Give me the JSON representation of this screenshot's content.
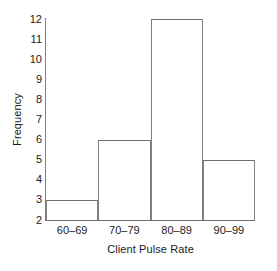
{
  "chart_data": {
    "type": "bar",
    "title": "",
    "subtitle": "",
    "xlabel": "Client Pulse Rate",
    "ylabel": "Frequency",
    "categories": [
      "60–69",
      "70–79",
      "80–89",
      "90–99"
    ],
    "values": [
      3,
      6,
      12,
      5
    ],
    "series": [
      {
        "name": "Frequency",
        "values": [
          3,
          6,
          12,
          5
        ]
      }
    ],
    "ylim": [
      2,
      12
    ],
    "yticks": [
      2,
      3,
      4,
      5,
      6,
      7,
      8,
      9,
      10,
      11,
      12
    ],
    "ytick_labels": [
      "2",
      "3",
      "4",
      "5",
      "6",
      "7",
      "8",
      "9",
      "10",
      "11",
      "12"
    ],
    "grid": false,
    "legend": false,
    "legend_position": "none",
    "bar_style": "histogram-contiguous",
    "colors": {
      "bar_fill": "#ffffff",
      "bar_edge": "#6e6e6e",
      "axis": "#808080",
      "text": "#1a1a1a",
      "background": "#ffffff"
    },
    "annotations": []
  }
}
